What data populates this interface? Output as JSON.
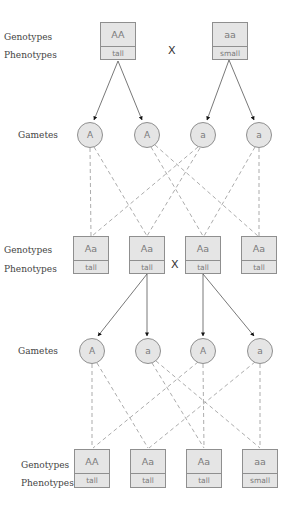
{
  "colors": {
    "box_fill": "#e5e5e5",
    "box_border": "#8f8f8f",
    "box_text": "#7a7a7a",
    "label_text": "#444444",
    "solid_arrow": "#555555",
    "dashed_line": "#888888"
  },
  "labels": {
    "genotypes": "Genotypes",
    "phenotypes": "Phenotypes",
    "gametes": "Gametes",
    "cross_symbol": "X"
  },
  "parents": [
    {
      "genotype": "AA",
      "phenotype": "tall"
    },
    {
      "genotype": "aa",
      "phenotype": "small"
    }
  ],
  "p_gametes": [
    "A",
    "A",
    "a",
    "a"
  ],
  "f1": [
    {
      "genotype": "Aa",
      "phenotype": "tall"
    },
    {
      "genotype": "Aa",
      "phenotype": "tall"
    },
    {
      "genotype": "Aa",
      "phenotype": "tall"
    },
    {
      "genotype": "Aa",
      "phenotype": "tall"
    }
  ],
  "f1_gametes": [
    "A",
    "a",
    "A",
    "a"
  ],
  "f2": [
    {
      "genotype": "AA",
      "phenotype": "tall"
    },
    {
      "genotype": "Aa",
      "phenotype": "tall"
    },
    {
      "genotype": "Aa",
      "phenotype": "tall"
    },
    {
      "genotype": "aa",
      "phenotype": "small"
    }
  ]
}
